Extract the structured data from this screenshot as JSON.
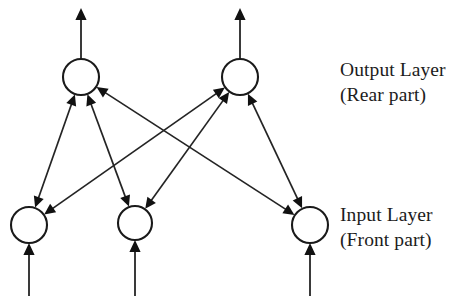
{
  "figure": {
    "type": "diagram",
    "background_color": "#ffffff",
    "line_color": "#242424",
    "node_fill": "#ffffff",
    "node_stroke": "#1a1a1a",
    "text_color": "#1c1c1c"
  },
  "labels": {
    "output_layer": {
      "line1": "Output Layer",
      "line2": "(Rear part)"
    },
    "input_layer": {
      "line1": "Input Layer",
      "line2": "(Front part)"
    }
  },
  "nodes": {
    "output": [
      {
        "id": "o1",
        "cx": 81,
        "cy": 77,
        "r": 18
      },
      {
        "id": "o2",
        "cx": 240,
        "cy": 77,
        "r": 18
      }
    ],
    "input": [
      {
        "id": "i1",
        "cx": 29,
        "cy": 225,
        "r": 18
      },
      {
        "id": "i2",
        "cx": 135,
        "cy": 223,
        "r": 17
      },
      {
        "id": "i3",
        "cx": 310,
        "cy": 225,
        "r": 18
      }
    ]
  },
  "connections": [
    {
      "from": "i1",
      "to": "o1",
      "bidirectional": true
    },
    {
      "from": "i2",
      "to": "o1",
      "bidirectional": true
    },
    {
      "from": "i3",
      "to": "o1",
      "bidirectional": true
    },
    {
      "from": "i1",
      "to": "o2",
      "bidirectional": true
    },
    {
      "from": "i2",
      "to": "o2",
      "bidirectional": true
    },
    {
      "from": "i3",
      "to": "o2",
      "bidirectional": true
    }
  ],
  "external_arrows": {
    "outputs": [
      {
        "node": "o1",
        "x": 81,
        "from_y": 59,
        "to_y": 8,
        "direction": "up"
      },
      {
        "node": "o2",
        "x": 240,
        "from_y": 59,
        "to_y": 8,
        "direction": "up"
      }
    ],
    "inputs": [
      {
        "node": "i1",
        "x": 29,
        "from_y": 296,
        "to_y": 243,
        "direction": "up"
      },
      {
        "node": "i2",
        "x": 135,
        "from_y": 296,
        "to_y": 240,
        "direction": "up"
      },
      {
        "node": "i3",
        "x": 310,
        "from_y": 296,
        "to_y": 243,
        "direction": "up"
      }
    ]
  },
  "label_positions": {
    "output": {
      "x": 340,
      "y1": 76,
      "y2": 101
    },
    "input": {
      "x": 340,
      "y1": 221,
      "y2": 246
    }
  }
}
